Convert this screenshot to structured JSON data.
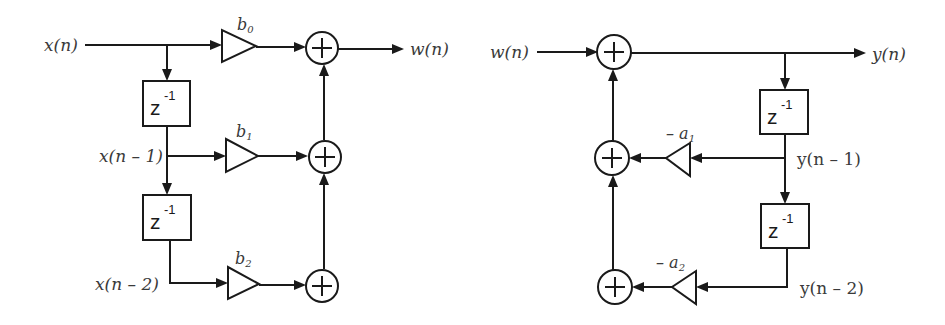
{
  "left_diagram": {
    "title": "FIR (feedforward) section",
    "input_label": "x(n)",
    "output_label": "w(n)",
    "tap_labels": [
      "x(n)",
      "x(n – 1)",
      "x(n – 2)"
    ],
    "delay_label": "z",
    "delay_exponent": "-1",
    "coefficients": [
      {
        "base": "b",
        "sub": "0"
      },
      {
        "base": "b",
        "sub": "1"
      },
      {
        "base": "b",
        "sub": "2"
      }
    ],
    "adder_symbol": "+"
  },
  "right_diagram": {
    "title": "IIR (feedback) section",
    "input_label": "w(n)",
    "output_label": "y(n)",
    "tap_labels": [
      "y(n – 1)",
      "y(n – 2)"
    ],
    "delay_label": "z",
    "delay_exponent": "-1",
    "coefficients": [
      {
        "base": "– a",
        "sub": "1"
      },
      {
        "base": "– a",
        "sub": "2"
      }
    ],
    "adder_symbol": "+"
  },
  "colors": {
    "stroke": "#1a1a1a",
    "label": "#3a3a3a",
    "background": "#ffffff"
  }
}
